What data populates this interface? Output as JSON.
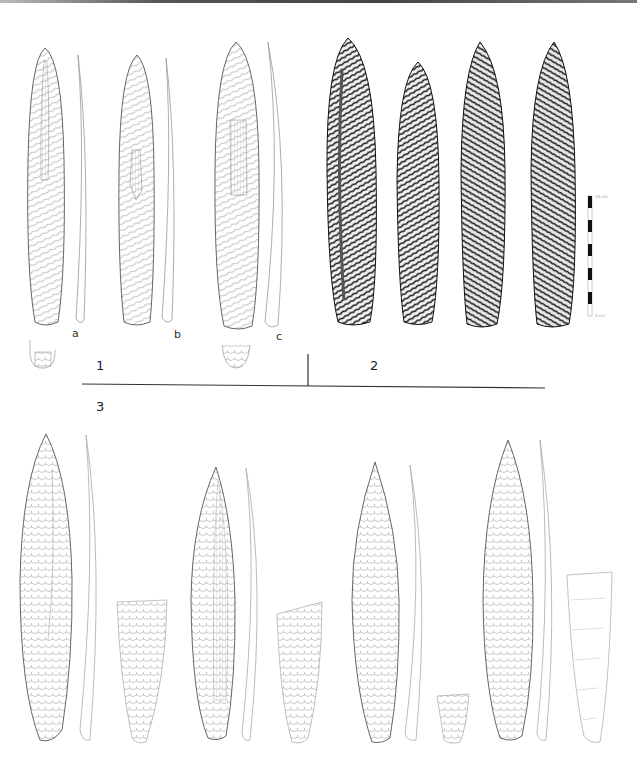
{
  "figure": {
    "panels": [
      {
        "id": "1",
        "label": "1",
        "description": "Line drawings of three flint daggers with lateral profiles",
        "items": [
          {
            "label": "a"
          },
          {
            "label": "b"
          },
          {
            "label": "c"
          }
        ]
      },
      {
        "id": "2",
        "label": "2",
        "description": "Stipple-shaded drawings of four flint daggers",
        "item_count": 4
      },
      {
        "id": "3",
        "label": "3",
        "description": "Line drawings of four flint daggers with profiles and cross-sections",
        "item_count": 4
      }
    ],
    "scale_bar": {
      "top_label": "10 cm",
      "bottom_label": "0 cm",
      "segments": 10
    },
    "colors": {
      "ink": "#333333",
      "stipple": "#1a1a1a",
      "background": "#ffffff"
    }
  }
}
